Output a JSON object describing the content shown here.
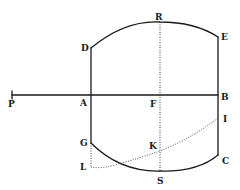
{
  "diagram": {
    "type": "geometric-figure",
    "style": "historical-engraving",
    "colors": {
      "ink": "#1a1a1a",
      "background": "#ffffff"
    },
    "labels": [
      {
        "id": "P",
        "text": "P",
        "x": 8,
        "y": 107
      },
      {
        "id": "A",
        "text": "A",
        "x": 80,
        "y": 106
      },
      {
        "id": "F",
        "text": "F",
        "x": 150,
        "y": 107
      },
      {
        "id": "B",
        "text": "B",
        "x": 221,
        "y": 100
      },
      {
        "id": "D",
        "text": "D",
        "x": 81,
        "y": 51
      },
      {
        "id": "R",
        "text": "R",
        "x": 155,
        "y": 20
      },
      {
        "id": "E",
        "text": "E",
        "x": 221,
        "y": 40
      },
      {
        "id": "G",
        "text": "G",
        "x": 80,
        "y": 146
      },
      {
        "id": "L",
        "text": "L",
        "x": 80,
        "y": 170
      },
      {
        "id": "K",
        "text": "K",
        "x": 149,
        "y": 149
      },
      {
        "id": "S",
        "text": "S",
        "x": 157,
        "y": 184
      },
      {
        "id": "I",
        "text": "I",
        "x": 223,
        "y": 122
      },
      {
        "id": "C",
        "text": "C",
        "x": 222,
        "y": 164
      }
    ],
    "lines": [
      {
        "name": "axis-PB",
        "from": "P",
        "to": "B",
        "style": "solid"
      },
      {
        "name": "side-DG",
        "from": "D",
        "to": "G",
        "style": "solid"
      },
      {
        "name": "side-EC",
        "from": "E",
        "to": "C",
        "style": "solid"
      },
      {
        "name": "arc-DRE",
        "from": "D",
        "through": "R",
        "to": "E",
        "style": "solid"
      },
      {
        "name": "arc-GSC",
        "from": "G",
        "through": "S",
        "to": "C",
        "style": "solid"
      },
      {
        "name": "line-RS",
        "from": "R",
        "to": "S",
        "style": "dotted"
      },
      {
        "name": "line-GL",
        "from": "G",
        "to": "L",
        "style": "dotted"
      },
      {
        "name": "curve-LKI",
        "from": "L",
        "through": "K",
        "to": "I",
        "style": "dotted"
      }
    ]
  }
}
